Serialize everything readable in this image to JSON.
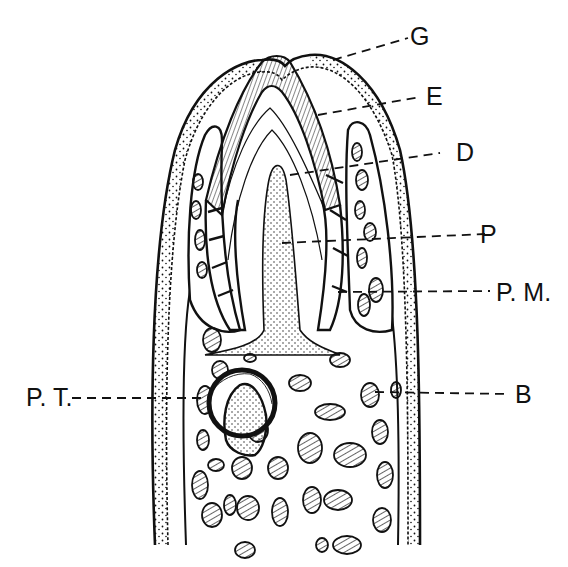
{
  "figure": {
    "type": "anatomical line drawing",
    "ink_color": "#111111",
    "background_color": "#ffffff"
  },
  "labels": [
    {
      "id": "G",
      "text": "G",
      "meaning_hint": "gum / gingiva (outer stippled epithelium)"
    },
    {
      "id": "E",
      "text": "E",
      "meaning_hint": "enamel (hatched cap)"
    },
    {
      "id": "D",
      "text": "D",
      "meaning_hint": "dentine"
    },
    {
      "id": "P",
      "text": "P",
      "meaning_hint": "pulp cavity"
    },
    {
      "id": "PM",
      "text": "P. M.",
      "meaning_hint": "periodontal membrane"
    },
    {
      "id": "PT",
      "text": "P. T.",
      "meaning_hint": "permanent / replacement tooth germ"
    },
    {
      "id": "B",
      "text": "B",
      "meaning_hint": "bone"
    }
  ]
}
